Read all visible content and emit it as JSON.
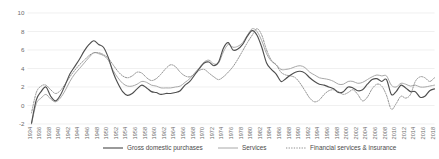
{
  "chart_data": {
    "type": "line",
    "title": "",
    "xlabel": "",
    "ylabel": "",
    "ylim": [
      -2,
      10
    ],
    "yticks": [
      -2,
      0,
      2,
      4,
      6,
      8,
      10
    ],
    "ytick_labels": [
      "-2",
      "0",
      "2",
      "4",
      "6",
      "8",
      "10"
    ],
    "grid": true,
    "legend_position": "bottom",
    "xlim": [
      1934,
      2018
    ],
    "xtick_step": 2,
    "x": [
      1934,
      1935,
      1936,
      1937,
      1938,
      1939,
      1940,
      1941,
      1942,
      1943,
      1944,
      1945,
      1946,
      1947,
      1948,
      1949,
      1950,
      1951,
      1952,
      1953,
      1954,
      1955,
      1956,
      1957,
      1958,
      1959,
      1960,
      1961,
      1962,
      1963,
      1964,
      1965,
      1966,
      1967,
      1968,
      1969,
      1970,
      1971,
      1972,
      1973,
      1974,
      1975,
      1976,
      1977,
      1978,
      1979,
      1980,
      1981,
      1982,
      1983,
      1984,
      1985,
      1986,
      1987,
      1988,
      1989,
      1990,
      1991,
      1992,
      1993,
      1994,
      1995,
      1996,
      1997,
      1998,
      1999,
      2000,
      2001,
      2002,
      2003,
      2004,
      2005,
      2006,
      2007,
      2008,
      2009,
      2010,
      2011,
      2012,
      2013,
      2014,
      2015,
      2016,
      2017,
      2018
    ],
    "xtick_labels": [
      "1934",
      "1936",
      "1938",
      "1940",
      "1942",
      "1944",
      "1946",
      "1948",
      "1950",
      "1952",
      "1954",
      "1956",
      "1958",
      "1960",
      "1962",
      "1964",
      "1966",
      "1968",
      "1970",
      "1972",
      "1974",
      "1976",
      "1978",
      "1980",
      "1982",
      "1984",
      "1986",
      "1988",
      "1990",
      "1992",
      "1994",
      "1996",
      "1998",
      "2000",
      "2002",
      "2004",
      "2006",
      "2008",
      "2010",
      "2012",
      "2014",
      "2016",
      "2018"
    ],
    "series": [
      {
        "name": "Gross domestic purchases",
        "style": "solid",
        "color": "#4f4f4f",
        "values": [
          -1.9,
          0.6,
          1.5,
          2.0,
          1.0,
          0.5,
          1.1,
          2.2,
          3.4,
          4.2,
          5.0,
          5.9,
          6.6,
          7.0,
          6.6,
          6.3,
          5.2,
          3.6,
          2.4,
          1.5,
          1.1,
          1.3,
          1.8,
          2.2,
          1.9,
          1.5,
          1.4,
          1.2,
          1.3,
          1.3,
          1.4,
          1.6,
          2.2,
          2.6,
          3.3,
          4.0,
          4.6,
          4.7,
          4.3,
          4.7,
          6.2,
          6.8,
          6.0,
          6.1,
          6.6,
          7.5,
          8.1,
          7.6,
          6.3,
          4.6,
          3.9,
          3.4,
          2.6,
          2.9,
          3.3,
          3.6,
          3.7,
          3.5,
          3.0,
          2.6,
          2.3,
          2.2,
          2.0,
          1.8,
          1.4,
          1.5,
          2.0,
          1.9,
          1.6,
          1.7,
          2.3,
          2.8,
          2.9,
          2.6,
          2.8,
          1.2,
          1.5,
          2.2,
          1.9,
          1.5,
          1.5,
          0.9,
          1.0,
          1.6,
          1.8
        ]
      },
      {
        "name": "Services",
        "style": "solid",
        "color": "#a8a8a8",
        "values": [
          -2.0,
          0.2,
          0.8,
          1.2,
          0.7,
          0.4,
          0.8,
          1.6,
          2.6,
          3.4,
          4.0,
          4.6,
          5.2,
          5.7,
          5.6,
          5.4,
          4.9,
          3.8,
          3.0,
          2.4,
          2.1,
          2.1,
          2.3,
          2.6,
          2.5,
          2.2,
          2.1,
          1.9,
          1.9,
          1.9,
          2.0,
          2.1,
          2.5,
          2.9,
          3.5,
          4.1,
          4.7,
          4.9,
          4.5,
          4.6,
          5.8,
          6.6,
          6.3,
          6.4,
          6.8,
          7.6,
          8.3,
          8.0,
          7.0,
          5.6,
          4.8,
          4.4,
          3.9,
          3.9,
          4.0,
          4.2,
          4.3,
          4.1,
          3.6,
          3.3,
          3.0,
          2.9,
          2.8,
          2.6,
          2.3,
          2.3,
          2.6,
          2.6,
          2.4,
          2.5,
          2.8,
          3.1,
          3.3,
          3.2,
          3.2,
          2.2,
          2.0,
          2.4,
          2.3,
          2.1,
          2.2,
          2.0,
          2.0,
          2.1,
          2.2
        ]
      },
      {
        "name": "Financial services & insurance",
        "style": "dotted",
        "color": "#8d8d8d",
        "values": [
          -0.8,
          1.4,
          2.1,
          2.2,
          1.7,
          1.3,
          1.6,
          2.3,
          3.1,
          3.8,
          4.4,
          4.9,
          5.4,
          5.7,
          5.7,
          5.5,
          5.1,
          4.4,
          3.7,
          3.2,
          3.0,
          3.2,
          3.6,
          3.5,
          3.0,
          2.7,
          2.9,
          3.4,
          4.0,
          4.4,
          4.2,
          3.6,
          3.2,
          3.1,
          3.4,
          3.8,
          3.9,
          3.5,
          3.1,
          2.8,
          3.1,
          3.6,
          4.2,
          5.0,
          5.9,
          6.8,
          7.6,
          8.3,
          7.6,
          6.0,
          4.9,
          4.4,
          3.6,
          3.3,
          3.2,
          3.0,
          2.4,
          1.6,
          0.8,
          0.4,
          0.6,
          1.2,
          1.6,
          1.7,
          1.5,
          1.2,
          1.4,
          1.7,
          1.2,
          0.5,
          0.9,
          1.8,
          2.3,
          2.1,
          1.1,
          -0.4,
          0.2,
          1.0,
          0.8,
          1.2,
          2.6,
          3.1,
          3.0,
          2.6,
          3.0
        ]
      }
    ]
  },
  "legend": {
    "items": [
      {
        "label": "Gross domestic purchases"
      },
      {
        "label": "Services"
      },
      {
        "label": "Financial services & insurance"
      }
    ]
  }
}
